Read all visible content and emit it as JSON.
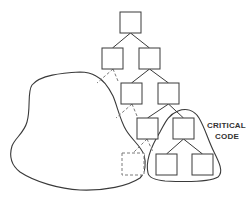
{
  "diagram": {
    "title": "",
    "colors": {
      "stroke": "#3a3a3a",
      "dashed": "#7a7a7a",
      "background": "#ffffff",
      "text": "#333333"
    },
    "nodes": [
      {
        "id": "root",
        "x": 120,
        "y": 12,
        "w": 21,
        "h": 21,
        "style": "solid"
      },
      {
        "id": "l2-left",
        "x": 102,
        "y": 48,
        "w": 21,
        "h": 21,
        "style": "solid"
      },
      {
        "id": "l2-right",
        "x": 139,
        "y": 48,
        "w": 21,
        "h": 21,
        "style": "solid"
      },
      {
        "id": "l3-left",
        "x": 121,
        "y": 83,
        "w": 21,
        "h": 21,
        "style": "solid"
      },
      {
        "id": "l3-right",
        "x": 158,
        "y": 83,
        "w": 21,
        "h": 21,
        "style": "solid"
      },
      {
        "id": "l4-left",
        "x": 137,
        "y": 118,
        "w": 21,
        "h": 21,
        "style": "solid"
      },
      {
        "id": "l4-right",
        "x": 173,
        "y": 118,
        "w": 21,
        "h": 21,
        "style": "solid"
      },
      {
        "id": "l5-left",
        "x": 156,
        "y": 154,
        "w": 21,
        "h": 21,
        "style": "solid"
      },
      {
        "id": "l5-right",
        "x": 192,
        "y": 154,
        "w": 21,
        "h": 21,
        "style": "solid"
      },
      {
        "id": "dashed-node",
        "x": 122,
        "y": 153,
        "w": 22,
        "h": 22,
        "style": "dashed"
      }
    ],
    "edges": [
      {
        "from": "root",
        "to": "l2-left",
        "style": "solid"
      },
      {
        "from": "root",
        "to": "l2-right",
        "style": "solid"
      },
      {
        "from": "l2-right",
        "to": "l3-left",
        "style": "solid"
      },
      {
        "from": "l2-right",
        "to": "l3-right",
        "style": "solid"
      },
      {
        "from": "l3-right",
        "to": "l4-left",
        "style": "solid"
      },
      {
        "from": "l3-right",
        "to": "l4-right",
        "style": "solid"
      },
      {
        "from": "l4-right",
        "to": "l5-left",
        "style": "solid"
      },
      {
        "from": "l4-right",
        "to": "l5-right",
        "style": "solid"
      }
    ],
    "dashed_links": [
      {
        "x1": 113,
        "y1": 69,
        "x2": 97,
        "y2": 83
      },
      {
        "x1": 113,
        "y1": 69,
        "x2": 118,
        "y2": 81
      },
      {
        "x1": 132,
        "y1": 104,
        "x2": 116,
        "y2": 118
      },
      {
        "x1": 132,
        "y1": 104,
        "x2": 137,
        "y2": 116
      },
      {
        "x1": 147,
        "y1": 139,
        "x2": 133,
        "y2": 153
      },
      {
        "x1": 147,
        "y1": 139,
        "x2": 153,
        "y2": 152
      }
    ],
    "regions": {
      "external_blob": "M 80 72 C 62 73, 40 75, 32 85 C 27 92, 31 108, 27 122 C 24 133, 15 138, 12 146 C 9 156, 11 165, 20 172 C 35 182, 60 189, 80 190 C 105 191, 128 186, 140 178 C 146 172, 146 162, 144 155 C 141 146, 132 140, 126 130 C 120 120, 117 105, 113 96 C 109 88, 104 80, 96 76 C 91 73, 86 72, 80 72 Z",
      "critical_region": "M 148 173 C 145 160, 152 145, 160 132 C 165 123, 168 115, 178 111 C 186 108, 194 110, 199 118 C 205 128, 208 140, 214 152 C 219 162, 224 172, 218 177 C 210 182, 185 182, 165 181 C 155 180, 149 178, 148 173 Z"
    },
    "labels": {
      "critical_line1": "CRITICAL",
      "critical_line2": "CODE"
    }
  }
}
